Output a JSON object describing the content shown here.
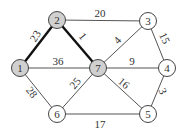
{
  "diagram": {
    "type": "weighted-undirected-graph",
    "colors": {
      "highlight_fill": "#d0d0d0",
      "normal_fill": "#ffffff",
      "stroke": "#444444",
      "edge": "#555555",
      "bold_edge": "#111111"
    },
    "nodes": [
      {
        "id": "1",
        "label": "1",
        "x": 20,
        "y": 68,
        "highlighted": true
      },
      {
        "id": "2",
        "label": "2",
        "x": 57,
        "y": 20,
        "highlighted": true
      },
      {
        "id": "3",
        "label": "3",
        "x": 148,
        "y": 21,
        "highlighted": false
      },
      {
        "id": "4",
        "label": "4",
        "x": 167,
        "y": 68,
        "highlighted": false
      },
      {
        "id": "5",
        "label": "5",
        "x": 148,
        "y": 114,
        "highlighted": false
      },
      {
        "id": "6",
        "label": "6",
        "x": 57,
        "y": 114,
        "highlighted": false
      },
      {
        "id": "7",
        "label": "7",
        "x": 98,
        "y": 68,
        "highlighted": true
      }
    ],
    "edges": [
      {
        "from": "1",
        "to": "2",
        "weight": "23",
        "bold": true,
        "lx": 35,
        "ly": 40,
        "rot": -58
      },
      {
        "from": "2",
        "to": "7",
        "weight": "1",
        "bold": true,
        "lx": 83,
        "ly": 40,
        "rot": 50
      },
      {
        "from": "2",
        "to": "3",
        "weight": "20",
        "bold": false,
        "lx": 100,
        "ly": 17,
        "rot": 0
      },
      {
        "from": "1",
        "to": "7",
        "weight": "36",
        "bold": false,
        "lx": 58,
        "ly": 65,
        "rot": 0
      },
      {
        "from": "7",
        "to": "3",
        "weight": "4",
        "bold": false,
        "lx": 117,
        "ly": 44,
        "rot": -48
      },
      {
        "from": "3",
        "to": "4",
        "weight": "15",
        "bold": false,
        "lx": 165,
        "ly": 42,
        "rot": 65
      },
      {
        "from": "7",
        "to": "4",
        "weight": "9",
        "bold": false,
        "lx": 132,
        "ly": 65,
        "rot": 0
      },
      {
        "from": "1",
        "to": "6",
        "weight": "28",
        "bold": false,
        "lx": 32,
        "ly": 96,
        "rot": 52
      },
      {
        "from": "7",
        "to": "6",
        "weight": "25",
        "bold": false,
        "lx": 75,
        "ly": 87,
        "rot": -50
      },
      {
        "from": "7",
        "to": "5",
        "weight": "16",
        "bold": false,
        "lx": 124,
        "ly": 87,
        "rot": 40
      },
      {
        "from": "4",
        "to": "5",
        "weight": "3",
        "bold": false,
        "lx": 163,
        "ly": 95,
        "rot": 65
      },
      {
        "from": "6",
        "to": "5",
        "weight": "17",
        "bold": false,
        "lx": 100,
        "ly": 128,
        "rot": 0
      }
    ]
  }
}
